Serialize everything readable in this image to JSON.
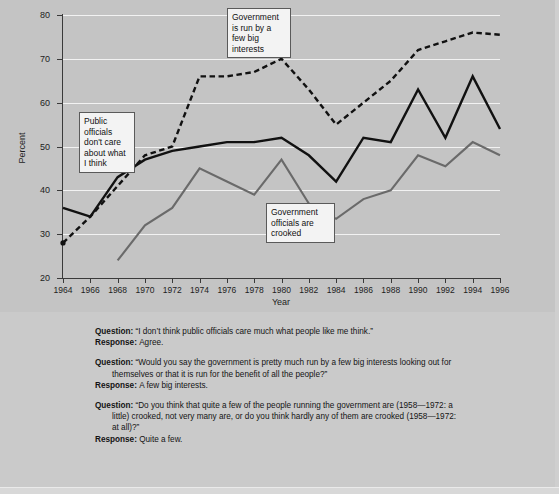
{
  "chart_data": {
    "type": "line",
    "title": "",
    "xlabel": "Year",
    "ylabel": "Percent",
    "ylim": [
      20,
      80
    ],
    "yticks": [
      20,
      30,
      40,
      50,
      60,
      70,
      80
    ],
    "grid": true,
    "legend_position": "inline-callouts",
    "categories": [
      1964,
      1966,
      1968,
      1970,
      1972,
      1974,
      1976,
      1978,
      1980,
      1982,
      1984,
      1986,
      1988,
      1990,
      1992,
      1994,
      1996
    ],
    "x": [
      1964,
      1966,
      1968,
      1970,
      1972,
      1974,
      1976,
      1978,
      1980,
      1982,
      1984,
      1986,
      1988,
      1990,
      1992,
      1994,
      1996
    ],
    "series": [
      {
        "name": "Government is run by a few big interests",
        "style": "dashed-black",
        "color": "#111111",
        "values": [
          28,
          34,
          41,
          48,
          50,
          66,
          66,
          67,
          70,
          63,
          55,
          60,
          65,
          72,
          74,
          76,
          75.5
        ]
      },
      {
        "name": "Public officials don't care about what I think",
        "style": "solid-black",
        "color": "#111111",
        "values": [
          36,
          34,
          43,
          47,
          49,
          50,
          51,
          51,
          52,
          48,
          42,
          52,
          51,
          63,
          52,
          66,
          54
        ]
      },
      {
        "name": "Government officials are crooked",
        "style": "solid-gray",
        "color": "#6a6a6a",
        "values": [
          null,
          null,
          24,
          32,
          36,
          45,
          42,
          39,
          47,
          37,
          33.5,
          38,
          40,
          48,
          45.5,
          51,
          48
        ]
      }
    ],
    "callouts": [
      {
        "id": "interests",
        "text": "Government\nis run by a\nfew big\ninterests"
      },
      {
        "id": "public",
        "text": "Public\nofficials\ndon't care\nabout what\n  I think"
      },
      {
        "id": "crooked",
        "text": "Government\nofficials are\ncrooked"
      }
    ]
  },
  "qa": [
    {
      "question_label": "Question",
      "question_text": "“I don’t think public officials care much what people like me think.”",
      "question_cont": "",
      "question_cont2": "",
      "response_label": "Response",
      "response_text": "Agree."
    },
    {
      "question_label": "Question",
      "question_text": "“Would you say the government is pretty much run by a few big interests looking out for",
      "question_cont": "themselves or that it is run for the benefit of all the people?”",
      "question_cont2": "",
      "response_label": "Response",
      "response_text": "A few big interests."
    },
    {
      "question_label": "Question",
      "question_text": "“Do you think that quite a few of the people running the government are (1958—1972: a",
      "question_cont": "little) crooked, not very many are, or do you think hardly any of them are crooked (1958—1972:",
      "question_cont2": "at all)?”",
      "response_label": "Response",
      "response_text": "Quite a few."
    }
  ],
  "colors": {
    "page_background": "#c6c6c6",
    "chart_background": "#c4c4c4",
    "gridline": "#f2f2f2",
    "axis": "#3a3a3a",
    "series_black": "#111111",
    "series_gray": "#6a6a6a",
    "callout_background": "#f3f3f3",
    "callout_border": "#5a5a5a"
  }
}
